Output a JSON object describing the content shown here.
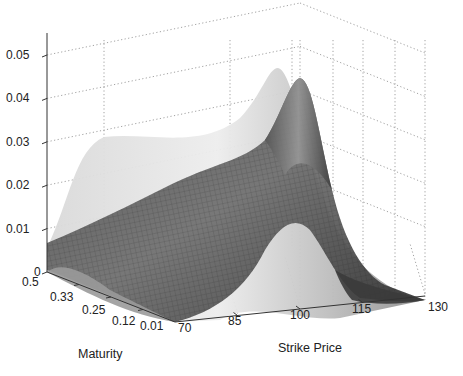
{
  "chart_data": {
    "type": "surface3d",
    "title": "",
    "xlabel": "Strike Price",
    "ylabel": "Maturity",
    "zlabel": "",
    "x_ticks": [
      "70",
      "85",
      "100",
      "115",
      "130"
    ],
    "y_ticks": [
      "0.5",
      "0.33",
      "0.25",
      "0.12",
      "0.01"
    ],
    "z_ticks": [
      "0",
      "0.01",
      "0.02",
      "0.03",
      "0.04",
      "0.05"
    ],
    "xlim": [
      70,
      130
    ],
    "ylim": [
      0.01,
      0.5
    ],
    "zlim": [
      0,
      0.05
    ],
    "grid": true,
    "series": [
      {
        "name": "shaded surface (light)",
        "style": "smooth shaded, light gray",
        "description": "density surface peaking near strike ~100 at short maturity",
        "peak": {
          "strike": 100,
          "maturity": 0.01,
          "value": 0.046
        },
        "edge_at_maturity_0.5": {
          "strike_70": 0.004,
          "peak_strike": 96,
          "peak_value": 0.021
        }
      },
      {
        "name": "mesh surface (dark)",
        "style": "wireframe mesh with dark shading",
        "description": "density surface peaking near strike ~102 at short maturity",
        "peak": {
          "strike": 102,
          "maturity": 0.01,
          "value": 0.044
        },
        "edge_at_maturity_0.5": {
          "strike_70": 0.006,
          "peak_strike": 98,
          "peak_value": 0.019
        }
      }
    ]
  },
  "labels": {
    "x_axis_title": "Strike Price",
    "y_axis_title": "Maturity"
  }
}
